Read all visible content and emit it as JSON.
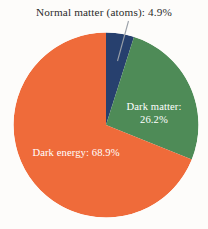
{
  "figure": {
    "name": "composition-of-the-universe-pie-chart",
    "background_color": "#fdfcfa"
  },
  "callout": {
    "text": "Normal matter (atoms): 4.9%",
    "leader_line_color": "#9aa0a8"
  },
  "labels": {
    "dark_matter_line1": "Dark matter:",
    "dark_matter_line2": "26.2%",
    "dark_energy": "Dark energy: 68.9%"
  },
  "chart_data": {
    "type": "pie",
    "title": "",
    "xlabel": "",
    "ylabel": "",
    "legend_position": "none",
    "grid": false,
    "start_angle_deg": 0,
    "direction": "clockwise",
    "units": "percent",
    "categories": [
      "Normal matter (atoms)",
      "Dark matter",
      "Dark energy"
    ],
    "values": [
      4.9,
      26.2,
      68.9
    ],
    "colors": [
      "#27406e",
      "#4e8b57",
      "#ef6b3a"
    ],
    "slices": [
      {
        "label": "Normal matter (atoms)",
        "value": 4.9,
        "display": "Normal matter (atoms): 4.9%",
        "color": "#27406e",
        "label_placement": "callout-above",
        "start_deg": 0.0,
        "end_deg": 17.64
      },
      {
        "label": "Dark matter",
        "value": 26.2,
        "display": "Dark matter: 26.2%",
        "color": "#4e8b57",
        "label_placement": "inside",
        "start_deg": 17.64,
        "end_deg": 111.96
      },
      {
        "label": "Dark energy",
        "value": 68.9,
        "display": "Dark energy: 68.9%",
        "color": "#ef6b3a",
        "label_placement": "inside",
        "start_deg": 111.96,
        "end_deg": 360.0
      }
    ]
  }
}
